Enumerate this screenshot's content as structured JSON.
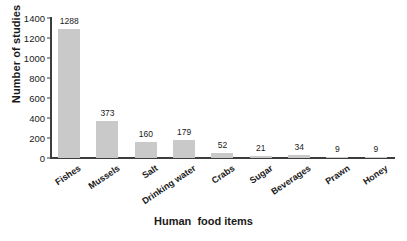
{
  "chart_data": {
    "type": "bar",
    "title": "",
    "xlabel": "Human  food items",
    "ylabel": "Number of studies",
    "categories": [
      "Fishes",
      "Mussels",
      "Salt",
      "Drinking water",
      "Crabs",
      "Sugar",
      "Beverages",
      "Prawn",
      "Honey"
    ],
    "values": [
      1288,
      373,
      160,
      179,
      52,
      21,
      34,
      9,
      9
    ],
    "value_labels": [
      "1288",
      "373",
      "160",
      "179",
      "52",
      "21",
      "34",
      "9",
      "9"
    ],
    "ylim": [
      0,
      1400
    ],
    "yticks": [
      0,
      200,
      400,
      600,
      800,
      1000,
      1200,
      1400
    ],
    "ytick_labels": [
      "0",
      "200",
      "400",
      "600",
      "800",
      "1000",
      "1200",
      "1400"
    ],
    "grid": false,
    "legend": null,
    "bar_color": "#c9c9c9",
    "axis_color": "#3d3d3d",
    "text_color": "#1a1a1a"
  }
}
